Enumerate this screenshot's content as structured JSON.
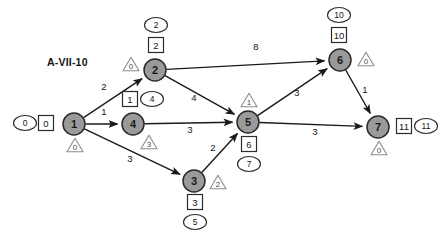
{
  "diagram": {
    "label": "A-VII-10",
    "type": "network-flow-graph",
    "colors": {
      "node_fill": "#9a9a9a",
      "node_stroke": "#2b2b2b",
      "edge": "#1a1a1a",
      "badge_stroke": "#2b2b2b",
      "triangle_stroke": "#8c8c8c",
      "background": "#ffffff"
    },
    "legend": {
      "ellipse_meaning": "ellipse-badge",
      "square_meaning": "square-badge",
      "triangle_meaning": "triangle-badge"
    },
    "nodes": [
      {
        "id": "1",
        "label": "1",
        "x": 74,
        "y": 124,
        "r": 11,
        "ellipse": "0",
        "square": "0",
        "triangle": "0"
      },
      {
        "id": "2",
        "label": "2",
        "x": 155,
        "y": 70,
        "r": 11,
        "ellipse": "2",
        "square": "2",
        "triangle": "0"
      },
      {
        "id": "3",
        "label": "3",
        "x": 194,
        "y": 181,
        "r": 11,
        "ellipse": "5",
        "square": "3",
        "triangle": "2"
      },
      {
        "id": "4",
        "label": "4",
        "x": 133,
        "y": 124,
        "r": 11,
        "ellipse": "4",
        "square": "1",
        "triangle": "3"
      },
      {
        "id": "5",
        "label": "5",
        "x": 248,
        "y": 122,
        "r": 11,
        "ellipse": "7",
        "square": "6",
        "triangle": "1"
      },
      {
        "id": "6",
        "label": "6",
        "x": 340,
        "y": 60,
        "r": 11,
        "ellipse": "10",
        "square": "10",
        "triangle": "0"
      },
      {
        "id": "7",
        "label": "7",
        "x": 378,
        "y": 127,
        "r": 11,
        "ellipse": "11",
        "square": "11",
        "triangle": "0"
      }
    ],
    "edges": [
      {
        "from": "1",
        "to": "2",
        "weight": "2",
        "lx": 104,
        "ly": 90
      },
      {
        "from": "1",
        "to": "4",
        "weight": "1",
        "lx": 104,
        "ly": 115
      },
      {
        "from": "1",
        "to": "3",
        "weight": "3",
        "lx": 130,
        "ly": 162
      },
      {
        "from": "2",
        "to": "6",
        "weight": "8",
        "lx": 256,
        "ly": 50
      },
      {
        "from": "2",
        "to": "5",
        "weight": "4",
        "lx": 194,
        "ly": 101
      },
      {
        "from": "4",
        "to": "5",
        "weight": "3",
        "lx": 190,
        "ly": 133
      },
      {
        "from": "3",
        "to": "5",
        "weight": "2",
        "lx": 213,
        "ly": 151
      },
      {
        "from": "5",
        "to": "6",
        "weight": "3",
        "lx": 297,
        "ly": 96
      },
      {
        "from": "5",
        "to": "7",
        "weight": "3",
        "lx": 315,
        "ly": 135
      },
      {
        "from": "6",
        "to": "7",
        "weight": "1",
        "lx": 365,
        "ly": 93
      }
    ]
  }
}
